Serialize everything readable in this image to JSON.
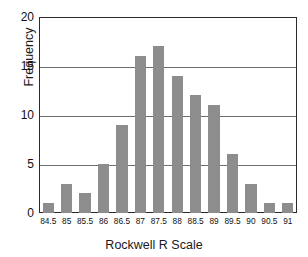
{
  "chart_data": {
    "type": "bar",
    "title": "",
    "subtitle": "",
    "xlabel": "Rockwell R Scale",
    "ylabel": "Frequency",
    "categories": [
      "84.5",
      "85",
      "85.5",
      "86",
      "86.5",
      "87",
      "87.5",
      "88",
      "88.5",
      "89",
      "89.5",
      "90",
      "90.5",
      "91"
    ],
    "values": [
      1,
      3,
      2,
      5,
      9,
      16,
      17,
      14,
      12,
      11,
      6,
      3,
      1,
      1
    ],
    "series": [
      {
        "name": "Frequency",
        "values": [
          1,
          3,
          2,
          5,
          9,
          16,
          17,
          14,
          12,
          11,
          6,
          3,
          1,
          1
        ]
      }
    ],
    "ylim": [
      0,
      20
    ],
    "yticks": [
      0,
      5,
      10,
      15,
      20
    ],
    "ytick_labels": [
      "0",
      "5",
      "10",
      "15",
      "20"
    ],
    "grid": true,
    "grid_axis": "y",
    "legend": null,
    "legend_position": "none",
    "bar_color": "#8d8d8d",
    "grid_color": "#6e6e6e",
    "frame_color": "#2b2b2b",
    "background_color": "#ffffff",
    "text_color": "#111111"
  }
}
